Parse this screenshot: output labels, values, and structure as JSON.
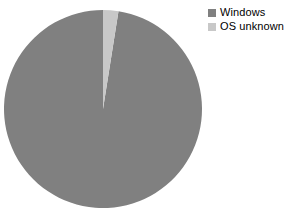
{
  "chart_data": {
    "type": "pie",
    "title": "",
    "categories": [
      "Windows",
      "OS unknown"
    ],
    "values": [
      97.5,
      2.5
    ],
    "colors": [
      "#808080",
      "#c8c8c8"
    ],
    "legend_position": "top-right",
    "start_angle": 90,
    "direction": "counterclockwise",
    "grid": false,
    "xlabel": "",
    "ylabel": "",
    "annotations": []
  },
  "legend": {
    "items": [
      {
        "label": "Windows",
        "color": "#808080"
      },
      {
        "label": "OS unknown",
        "color": "#c8c8c8"
      }
    ]
  },
  "pie": {
    "center_x": 103,
    "center_y": 109,
    "radius": 99,
    "slices": [
      {
        "name": "Windows",
        "value": 97.5,
        "color": "#808080"
      },
      {
        "name": "OS unknown",
        "value": 2.5,
        "color": "#c8c8c8"
      }
    ]
  }
}
